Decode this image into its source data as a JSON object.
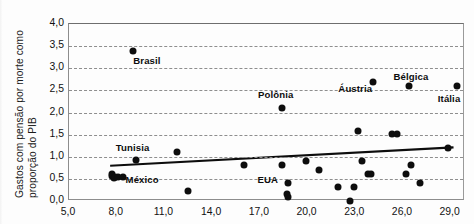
{
  "chart_data": {
    "type": "scatter",
    "title": "",
    "xlabel": "",
    "ylabel": "Gastos com pensão por morte como proporção do PIB",
    "ylabel_line1": "Gastos com pensão por morte como",
    "ylabel_line2": "proporção do PIB",
    "xlim": [
      5.0,
      29.9
    ],
    "ylim": [
      0.0,
      4.0
    ],
    "grid": true,
    "grid_style": "dashed horizontal",
    "legend": "none",
    "xticks": [
      "5,0",
      "8,0",
      "11,0",
      "14,0",
      "17,0",
      "20,0",
      "23,0",
      "26,0",
      "29,0"
    ],
    "xtick_values": [
      5.0,
      8.0,
      11.0,
      14.0,
      17.0,
      20.0,
      23.0,
      26.0,
      29.0
    ],
    "yticks": [
      "0,0",
      "0,5",
      "1,0",
      "1,5",
      "2,0",
      "2,5",
      "3,0",
      "3,5",
      "4,0"
    ],
    "ytick_values": [
      0.0,
      0.5,
      1.0,
      1.5,
      2.0,
      2.5,
      3.0,
      3.5,
      4.0
    ],
    "marker_color": "#0d0d0d",
    "trendline": {
      "color": "#0d0d0d",
      "x_start": 7.6,
      "y_start": 0.76,
      "x_end": 29.3,
      "y_end": 1.18
    },
    "points": [
      {
        "x": 7.7,
        "y": 0.62,
        "label": ""
      },
      {
        "x": 7.7,
        "y": 0.56,
        "label": ""
      },
      {
        "x": 7.8,
        "y": 0.52,
        "label": ""
      },
      {
        "x": 7.9,
        "y": 0.55,
        "label": ""
      },
      {
        "x": 8.1,
        "y": 0.54,
        "label": ""
      },
      {
        "x": 8.4,
        "y": 0.54,
        "label": ""
      },
      {
        "x": 9.0,
        "y": 3.38,
        "label": "Brasil"
      },
      {
        "x": 9.2,
        "y": 0.92,
        "label": ""
      },
      {
        "x": 11.8,
        "y": 1.11,
        "label": ""
      },
      {
        "x": 12.5,
        "y": 0.22,
        "label": ""
      },
      {
        "x": 16.0,
        "y": 0.81,
        "label": ""
      },
      {
        "x": 18.4,
        "y": 2.1,
        "label": "Polônia"
      },
      {
        "x": 18.4,
        "y": 0.81,
        "label": ""
      },
      {
        "x": 18.8,
        "y": 0.4,
        "label": ""
      },
      {
        "x": 18.7,
        "y": 0.15,
        "label": ""
      },
      {
        "x": 18.8,
        "y": 0.08,
        "label": ""
      },
      {
        "x": 19.9,
        "y": 0.91,
        "label": ""
      },
      {
        "x": 20.7,
        "y": 0.69,
        "label": ""
      },
      {
        "x": 21.9,
        "y": 0.32,
        "label": ""
      },
      {
        "x": 22.7,
        "y": 0.0,
        "label": ""
      },
      {
        "x": 22.9,
        "y": 0.32,
        "label": ""
      },
      {
        "x": 23.2,
        "y": 1.58,
        "label": ""
      },
      {
        "x": 23.4,
        "y": 0.91,
        "label": ""
      },
      {
        "x": 23.8,
        "y": 0.61,
        "label": ""
      },
      {
        "x": 24.0,
        "y": 0.61,
        "label": ""
      },
      {
        "x": 24.1,
        "y": 2.7,
        "label": "Áustria"
      },
      {
        "x": 25.3,
        "y": 1.51,
        "label": ""
      },
      {
        "x": 25.6,
        "y": 1.51,
        "label": ""
      },
      {
        "x": 26.2,
        "y": 0.61,
        "label": ""
      },
      {
        "x": 26.4,
        "y": 2.6,
        "label": "Bélgica"
      },
      {
        "x": 26.5,
        "y": 0.81,
        "label": ""
      },
      {
        "x": 27.1,
        "y": 0.4,
        "label": ""
      },
      {
        "x": 28.8,
        "y": 1.2,
        "label": ""
      },
      {
        "x": 29.4,
        "y": 2.6,
        "label": "Itália"
      }
    ],
    "annotations": [
      {
        "text": "Brasil",
        "x": 9.9,
        "y": 3.18,
        "anchor": "left"
      },
      {
        "text": "Polônia",
        "x": 18.0,
        "y": 2.42,
        "anchor": "center"
      },
      {
        "text": "Áustria",
        "x": 23.0,
        "y": 2.55,
        "anchor": "right"
      },
      {
        "text": "Bélgica",
        "x": 26.5,
        "y": 2.82,
        "anchor": "center"
      },
      {
        "text": "Itália",
        "x": 28.9,
        "y": 2.33,
        "anchor": "right"
      },
      {
        "text": "Tunisia",
        "x": 9.0,
        "y": 1.22,
        "anchor": "center"
      },
      {
        "text": "México",
        "x": 9.6,
        "y": 0.5,
        "anchor": "left"
      },
      {
        "text": "EUA",
        "x": 17.5,
        "y": 0.5,
        "anchor": "center"
      }
    ]
  }
}
